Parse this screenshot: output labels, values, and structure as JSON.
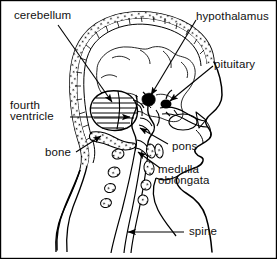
{
  "figure": {
    "width": 277,
    "height": 259,
    "background_color": "#ffffff",
    "ink_color": "#000000",
    "text_color": "#111111"
  },
  "labels": {
    "cerebellum": "cerebellum",
    "hypothalamus": "hypothalamus",
    "pituitary": "pituitary",
    "fourth_ventricle_line1": "fourth",
    "fourth_ventricle_line2": "ventricle",
    "bone": "bone",
    "pons": "pons",
    "medulla_line1": "medulla",
    "medulla_line2": "oblongata",
    "spine": "spine"
  }
}
